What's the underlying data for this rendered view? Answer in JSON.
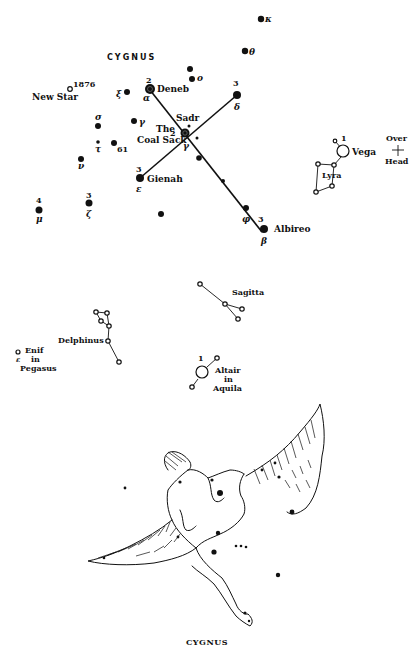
{
  "chart": {
    "title": "CYGNUS",
    "caption": "CYGNUS"
  },
  "stars": {
    "deneb": {
      "name": "Deneb",
      "greek": "α",
      "mag": "2"
    },
    "sadr": {
      "name": "Sadr",
      "greek": "γ",
      "mag": "2"
    },
    "delta": {
      "greek": "δ",
      "mag": "3"
    },
    "gienah": {
      "name": "Gienah",
      "greek": "ε",
      "mag": "3"
    },
    "albireo": {
      "name": "Albireo",
      "greek": "β",
      "mag": "3"
    },
    "phi": {
      "greek": "φ"
    },
    "kappa": {
      "greek": "κ"
    },
    "theta": {
      "greek": "θ"
    },
    "omicron": {
      "greek": "o"
    },
    "xi": {
      "greek": "ξ"
    },
    "gamma_small": {
      "greek": "γ"
    },
    "sigma": {
      "greek": "σ"
    },
    "tau": {
      "greek": "τ"
    },
    "s61": {
      "label": "61"
    },
    "nu": {
      "greek": "ν"
    },
    "zeta": {
      "greek": "ζ",
      "mag": "3"
    },
    "mu": {
      "greek": "μ",
      "mag": "4"
    },
    "new_star": {
      "name": "New Star",
      "year": "1876"
    },
    "coal_sack": {
      "line1": "The",
      "line2": "Coal Sack"
    }
  },
  "neighbors": {
    "vega": {
      "name": "Vega",
      "mag": "1"
    },
    "lyra": {
      "name": "Lyra"
    },
    "overhead": {
      "line1": "Over",
      "line2": "Head"
    },
    "sagitta": {
      "name": "Sagitta"
    },
    "delphinus": {
      "name": "Delphinus"
    },
    "enif": {
      "line1": "Enif",
      "line2": "in",
      "line3": "Pegasus",
      "greek": "ε"
    },
    "altair": {
      "line1": "Altair",
      "line2": "in",
      "line3": "Aquila",
      "mag": "1"
    }
  }
}
